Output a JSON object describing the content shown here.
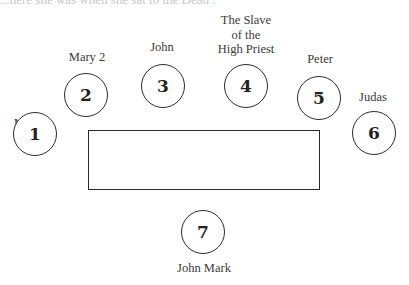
{
  "header_fragment": "...here she was when she sat to the Dead ...",
  "table": {
    "shape": "rectangle"
  },
  "seats": [
    {
      "number": "1",
      "name": "Mary 1"
    },
    {
      "number": "2",
      "name": "Mary 2"
    },
    {
      "number": "3",
      "name": "John"
    },
    {
      "number": "4",
      "name_lines": [
        "The Slave",
        "of the",
        "High Priest"
      ]
    },
    {
      "number": "5",
      "name": "Peter"
    },
    {
      "number": "6",
      "name": "Judas"
    },
    {
      "number": "7",
      "name": "John Mark"
    }
  ]
}
